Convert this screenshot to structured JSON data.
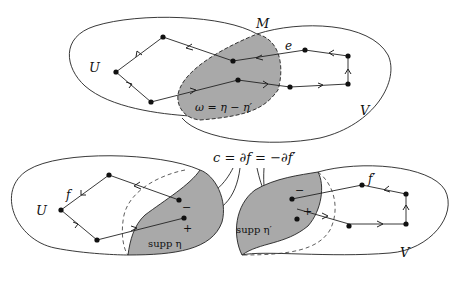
{
  "top": {
    "labels": {
      "M": "M",
      "U": "U",
      "V": "V",
      "e": "e",
      "omega": "ω = η − η′"
    }
  },
  "bottom": {
    "equation": "c = ∂f = −∂f′",
    "left": {
      "U": "U",
      "f": "f",
      "supp": "supp η",
      "minus": "−",
      "plus": "+"
    },
    "right": {
      "V": "V",
      "f": "f′",
      "supp": "supp η′",
      "minus": "−",
      "plus": "+"
    }
  },
  "colors": {
    "shade": "#a9a9a9",
    "line": "#222222"
  }
}
